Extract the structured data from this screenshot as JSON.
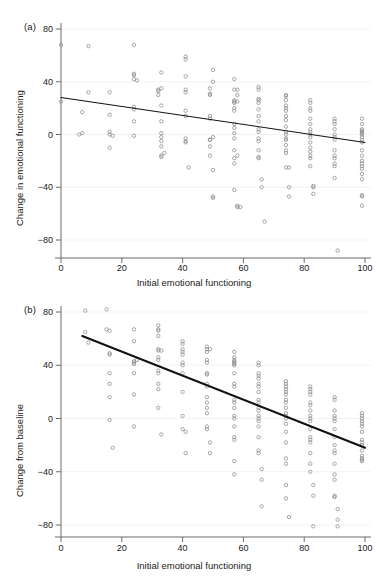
{
  "figure": {
    "panels": [
      {
        "label": "(a)",
        "ylabel": "Change in emotional functioning",
        "xlabel": "Initial emotional functioning"
      },
      {
        "label": "(b)",
        "ylabel": "Change from baseline",
        "xlabel": "Initial emotional functioning"
      }
    ]
  },
  "chart_data": [
    {
      "type": "scatter",
      "panel": "(a)",
      "title": "",
      "xlabel": "Initial emotional functioning",
      "ylabel": "Change in emotional functioning",
      "xlim": [
        0,
        100
      ],
      "ylim": [
        -95,
        85
      ],
      "xticks": [
        0,
        20,
        40,
        60,
        80,
        100
      ],
      "yticks": [
        80,
        40,
        0,
        -40,
        -80
      ],
      "xtick_labels": [
        "0",
        "20",
        "40",
        "60",
        "80",
        "100"
      ],
      "ytick_labels": [
        "80",
        "40",
        "0",
        "-40",
        "-80"
      ],
      "grid": false,
      "legend": "none",
      "marker": "open-circle",
      "marker_color": "#8a8a8a",
      "fit_line": {
        "type": "linear",
        "color": "#111111",
        "x_start": 0,
        "y_start": 28,
        "x_end": 100,
        "y_end": -6,
        "slope": -0.34,
        "intercept": 28
      },
      "points": [
        [
          0,
          25
        ],
        [
          0,
          68
        ],
        [
          6,
          0
        ],
        [
          7,
          17
        ],
        [
          7,
          1
        ],
        [
          9,
          32
        ],
        [
          9,
          67
        ],
        [
          16,
          32
        ],
        [
          16,
          2
        ],
        [
          16,
          0
        ],
        [
          16,
          -10
        ],
        [
          16,
          15
        ],
        [
          17,
          -1
        ],
        [
          24,
          68
        ],
        [
          24,
          46
        ],
        [
          24,
          45
        ],
        [
          24,
          42
        ],
        [
          24,
          21
        ],
        [
          24,
          10
        ],
        [
          24,
          19
        ],
        [
          24,
          -1
        ],
        [
          25,
          41
        ],
        [
          32,
          33
        ],
        [
          32,
          34
        ],
        [
          32,
          30
        ],
        [
          33,
          47
        ],
        [
          33,
          35
        ],
        [
          33,
          22
        ],
        [
          33,
          10
        ],
        [
          33,
          -9
        ],
        [
          33,
          -16
        ],
        [
          33,
          -17
        ],
        [
          33,
          -2
        ],
        [
          33,
          -5
        ],
        [
          33,
          1
        ],
        [
          34,
          -14
        ],
        [
          41,
          57
        ],
        [
          41,
          59
        ],
        [
          41,
          44
        ],
        [
          41,
          34
        ],
        [
          41,
          32
        ],
        [
          41,
          18
        ],
        [
          41,
          14
        ],
        [
          41,
          -5
        ],
        [
          41,
          -6
        ],
        [
          41,
          -3
        ],
        [
          42,
          -25
        ],
        [
          49,
          35
        ],
        [
          49,
          31
        ],
        [
          49,
          30
        ],
        [
          49,
          12
        ],
        [
          49,
          14
        ],
        [
          49,
          -4
        ],
        [
          49,
          -9
        ],
        [
          49,
          -16
        ],
        [
          49,
          -4
        ],
        [
          50,
          49
        ],
        [
          50,
          40
        ],
        [
          50,
          -2
        ],
        [
          50,
          -27
        ],
        [
          50,
          -48
        ],
        [
          50,
          -47
        ],
        [
          57,
          42
        ],
        [
          57,
          34
        ],
        [
          57,
          25
        ],
        [
          57,
          26
        ],
        [
          57,
          24
        ],
        [
          57,
          20
        ],
        [
          57,
          18
        ],
        [
          57,
          8
        ],
        [
          57,
          5
        ],
        [
          57,
          1
        ],
        [
          57,
          -3
        ],
        [
          57,
          -12
        ],
        [
          57,
          -18
        ],
        [
          57,
          -22
        ],
        [
          57,
          -42
        ],
        [
          58,
          30
        ],
        [
          58,
          34
        ],
        [
          58,
          25
        ],
        [
          58,
          -16
        ],
        [
          58,
          -55
        ],
        [
          58,
          -54
        ],
        [
          59,
          -55
        ],
        [
          65,
          36
        ],
        [
          65,
          34
        ],
        [
          65,
          27
        ],
        [
          65,
          26
        ],
        [
          65,
          24
        ],
        [
          65,
          19
        ],
        [
          65,
          14
        ],
        [
          65,
          10
        ],
        [
          65,
          4
        ],
        [
          65,
          2
        ],
        [
          65,
          -3
        ],
        [
          65,
          -5
        ],
        [
          65,
          -12
        ],
        [
          65,
          -17
        ],
        [
          65,
          -18
        ],
        [
          66,
          -34
        ],
        [
          66,
          -40
        ],
        [
          67,
          -66
        ],
        [
          74,
          30
        ],
        [
          74,
          29
        ],
        [
          74,
          26
        ],
        [
          74,
          22
        ],
        [
          74,
          20
        ],
        [
          74,
          18
        ],
        [
          74,
          14
        ],
        [
          74,
          11
        ],
        [
          74,
          6
        ],
        [
          74,
          2
        ],
        [
          74,
          0
        ],
        [
          74,
          -3
        ],
        [
          74,
          -4
        ],
        [
          74,
          -8
        ],
        [
          74,
          -12
        ],
        [
          74,
          -14
        ],
        [
          74,
          -25
        ],
        [
          75,
          -25
        ],
        [
          75,
          -40
        ],
        [
          75,
          -47
        ],
        [
          82,
          26
        ],
        [
          82,
          24
        ],
        [
          82,
          20
        ],
        [
          82,
          18
        ],
        [
          82,
          12
        ],
        [
          82,
          8
        ],
        [
          82,
          4
        ],
        [
          82,
          2
        ],
        [
          82,
          0
        ],
        [
          82,
          -2
        ],
        [
          82,
          -6
        ],
        [
          82,
          -10
        ],
        [
          82,
          -13
        ],
        [
          82,
          -16
        ],
        [
          82,
          -18
        ],
        [
          82,
          -24
        ],
        [
          83,
          -40
        ],
        [
          83,
          -45
        ],
        [
          83,
          -39
        ],
        [
          90,
          10
        ],
        [
          90,
          12
        ],
        [
          90,
          8
        ],
        [
          90,
          4
        ],
        [
          90,
          0
        ],
        [
          90,
          -2
        ],
        [
          90,
          -4
        ],
        [
          90,
          -12
        ],
        [
          90,
          -16
        ],
        [
          90,
          -18
        ],
        [
          90,
          -22
        ],
        [
          90,
          -24
        ],
        [
          90,
          -33
        ],
        [
          91,
          -88
        ],
        [
          99,
          12
        ],
        [
          99,
          8
        ],
        [
          99,
          4
        ],
        [
          99,
          2
        ],
        [
          99,
          0
        ],
        [
          99,
          -2
        ],
        [
          99,
          -4
        ],
        [
          99,
          -6
        ],
        [
          99,
          -12
        ],
        [
          99,
          -16
        ],
        [
          99,
          -20
        ],
        [
          99,
          -22
        ],
        [
          99,
          -24
        ],
        [
          99,
          -26
        ],
        [
          99,
          -30
        ],
        [
          99,
          -34
        ],
        [
          99,
          -46
        ],
        [
          99,
          -47
        ],
        [
          99,
          -54
        ],
        [
          99,
          1
        ],
        [
          99,
          3
        ]
      ]
    },
    {
      "type": "scatter",
      "panel": "(b)",
      "title": "",
      "xlabel": "Initial emotional functioning",
      "ylabel": "Change from baseline",
      "xlim": [
        0,
        100
      ],
      "ylim": [
        -95,
        88
      ],
      "xticks": [
        0,
        20,
        40,
        60,
        80,
        100
      ],
      "yticks": [
        80,
        40,
        0,
        -40,
        -80
      ],
      "xtick_labels": [
        "0",
        "20",
        "40",
        "60",
        "80",
        "100"
      ],
      "ytick_labels": [
        "80",
        "40",
        "0",
        "-40",
        "-80"
      ],
      "grid": false,
      "legend": "none",
      "marker": "open-circle",
      "marker_color": "#8a8a8a",
      "fit_line": {
        "type": "linear",
        "color": "#111111",
        "x_start": 7,
        "y_start": 62,
        "x_end": 100,
        "y_end": -22,
        "slope": -0.9,
        "intercept": 68
      },
      "points": [
        [
          8,
          81
        ],
        [
          8,
          65
        ],
        [
          9,
          57
        ],
        [
          15,
          82
        ],
        [
          15,
          67
        ],
        [
          16,
          66
        ],
        [
          16,
          49
        ],
        [
          16,
          48
        ],
        [
          16,
          34
        ],
        [
          16,
          26
        ],
        [
          16,
          16
        ],
        [
          16,
          -1
        ],
        [
          17,
          -22
        ],
        [
          24,
          67
        ],
        [
          24,
          58
        ],
        [
          24,
          43
        ],
        [
          24,
          42
        ],
        [
          24,
          41
        ],
        [
          24,
          34
        ],
        [
          24,
          18
        ],
        [
          24,
          -6
        ],
        [
          25,
          44
        ],
        [
          32,
          70
        ],
        [
          32,
          67
        ],
        [
          32,
          66
        ],
        [
          32,
          62
        ],
        [
          32,
          52
        ],
        [
          32,
          51
        ],
        [
          32,
          46
        ],
        [
          32,
          44
        ],
        [
          32,
          36
        ],
        [
          32,
          34
        ],
        [
          32,
          26
        ],
        [
          32,
          22
        ],
        [
          32,
          8
        ],
        [
          33,
          -12
        ],
        [
          33,
          51
        ],
        [
          40,
          58
        ],
        [
          40,
          56
        ],
        [
          40,
          52
        ],
        [
          40,
          50
        ],
        [
          40,
          48
        ],
        [
          40,
          42
        ],
        [
          40,
          40
        ],
        [
          40,
          34
        ],
        [
          40,
          20
        ],
        [
          40,
          2
        ],
        [
          40,
          -8
        ],
        [
          41,
          -10
        ],
        [
          41,
          -26
        ],
        [
          48,
          54
        ],
        [
          48,
          52
        ],
        [
          48,
          50
        ],
        [
          48,
          44
        ],
        [
          48,
          42
        ],
        [
          48,
          34
        ],
        [
          48,
          33
        ],
        [
          48,
          26
        ],
        [
          48,
          24
        ],
        [
          48,
          16
        ],
        [
          48,
          12
        ],
        [
          48,
          8
        ],
        [
          48,
          4
        ],
        [
          48,
          -6
        ],
        [
          48,
          -8
        ],
        [
          49,
          -18
        ],
        [
          49,
          -26
        ],
        [
          49,
          52
        ],
        [
          57,
          50
        ],
        [
          57,
          46
        ],
        [
          57,
          44
        ],
        [
          57,
          43
        ],
        [
          57,
          42
        ],
        [
          57,
          41
        ],
        [
          57,
          40
        ],
        [
          57,
          34
        ],
        [
          57,
          26
        ],
        [
          57,
          24
        ],
        [
          57,
          14
        ],
        [
          57,
          12
        ],
        [
          57,
          8
        ],
        [
          57,
          2
        ],
        [
          57,
          0
        ],
        [
          57,
          -6
        ],
        [
          57,
          -14
        ],
        [
          57,
          -16
        ],
        [
          57,
          -32
        ],
        [
          57,
          -42
        ],
        [
          65,
          42
        ],
        [
          65,
          40
        ],
        [
          65,
          34
        ],
        [
          65,
          32
        ],
        [
          65,
          30
        ],
        [
          65,
          26
        ],
        [
          65,
          24
        ],
        [
          65,
          20
        ],
        [
          65,
          14
        ],
        [
          65,
          12
        ],
        [
          65,
          8
        ],
        [
          65,
          6
        ],
        [
          65,
          2
        ],
        [
          65,
          0
        ],
        [
          65,
          -2
        ],
        [
          65,
          -6
        ],
        [
          65,
          -14
        ],
        [
          65,
          -24
        ],
        [
          65,
          -26
        ],
        [
          66,
          -38
        ],
        [
          66,
          -46
        ],
        [
          66,
          -66
        ],
        [
          74,
          28
        ],
        [
          74,
          26
        ],
        [
          74,
          24
        ],
        [
          74,
          22
        ],
        [
          74,
          20
        ],
        [
          74,
          18
        ],
        [
          74,
          14
        ],
        [
          74,
          12
        ],
        [
          74,
          8
        ],
        [
          74,
          4
        ],
        [
          74,
          2
        ],
        [
          74,
          0
        ],
        [
          74,
          -4
        ],
        [
          74,
          -10
        ],
        [
          74,
          -18
        ],
        [
          74,
          -30
        ],
        [
          74,
          -34
        ],
        [
          74,
          -50
        ],
        [
          74,
          -60
        ],
        [
          75,
          -74
        ],
        [
          82,
          24
        ],
        [
          82,
          22
        ],
        [
          82,
          20
        ],
        [
          82,
          18
        ],
        [
          82,
          12
        ],
        [
          82,
          10
        ],
        [
          82,
          6
        ],
        [
          82,
          2
        ],
        [
          82,
          0
        ],
        [
          82,
          -2
        ],
        [
          82,
          -8
        ],
        [
          82,
          -14
        ],
        [
          82,
          -16
        ],
        [
          82,
          -18
        ],
        [
          82,
          -26
        ],
        [
          82,
          -34
        ],
        [
          82,
          -40
        ],
        [
          83,
          -50
        ],
        [
          83,
          -58
        ],
        [
          83,
          -81
        ],
        [
          90,
          16
        ],
        [
          90,
          14
        ],
        [
          90,
          6
        ],
        [
          90,
          2
        ],
        [
          90,
          0
        ],
        [
          90,
          -2
        ],
        [
          90,
          -8
        ],
        [
          90,
          -14
        ],
        [
          90,
          -20
        ],
        [
          90,
          -24
        ],
        [
          90,
          -26
        ],
        [
          90,
          -34
        ],
        [
          90,
          -42
        ],
        [
          90,
          -46
        ],
        [
          90,
          -58
        ],
        [
          90,
          -59
        ],
        [
          91,
          -68
        ],
        [
          91,
          -76
        ],
        [
          91,
          -81
        ],
        [
          99,
          4
        ],
        [
          99,
          2
        ],
        [
          99,
          0
        ],
        [
          99,
          -2
        ],
        [
          99,
          -4
        ],
        [
          99,
          -6
        ],
        [
          99,
          -10
        ],
        [
          99,
          -16
        ],
        [
          99,
          -18
        ],
        [
          99,
          -20
        ],
        [
          99,
          -24
        ],
        [
          99,
          -28
        ],
        [
          99,
          -30
        ],
        [
          99,
          -31
        ],
        [
          99,
          -32
        ]
      ]
    }
  ]
}
